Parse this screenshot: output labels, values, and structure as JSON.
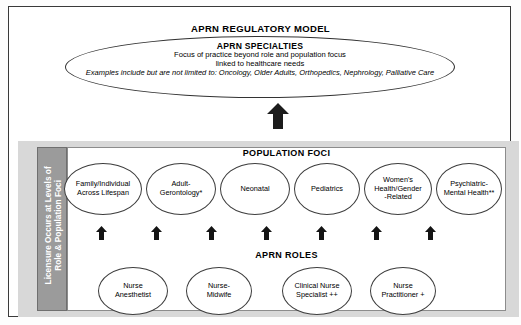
{
  "diagram": {
    "title": "APRN REGULATORY MODEL",
    "specialties": {
      "heading": "APRN SPECIALTIES",
      "line1": "Focus of practice beyond role and population focus",
      "line2": "linked to healthcare needs",
      "examples": "Examples include but are not limited to: Oncology, Older Adults, Orthopedics, Nephrology, Palliative Care"
    },
    "sidebar": {
      "label": "Licensure Occurs at Levels of\nRole & Population Foci"
    },
    "population": {
      "heading": "POPULATION FOCI",
      "nodes": [
        {
          "label": "Family/Individual\nAcross Lifespan",
          "left": 64,
          "width": 78
        },
        {
          "label": "Adult-\nGerontology*",
          "left": 146,
          "width": 70
        },
        {
          "label": "Neonatal",
          "left": 220,
          "width": 70
        },
        {
          "label": "Pediatrics",
          "left": 294,
          "width": 66
        },
        {
          "label": "Women's\nHealth/Gender\n-Related",
          "left": 364,
          "width": 68
        },
        {
          "label": "Psychiatric-\nMental Health**",
          "left": 436,
          "width": 66
        }
      ]
    },
    "roles": {
      "heading": "APRN ROLES",
      "nodes": [
        {
          "label": "Nurse\nAnesthetist",
          "left": 98,
          "width": 70
        },
        {
          "label": "Nurse-\nMidwife",
          "left": 186,
          "width": 66
        },
        {
          "label": "Clinical Nurse\nSpecialist ++",
          "left": 282,
          "width": 70
        },
        {
          "label": "Nurse\nPractitioner +",
          "left": 370,
          "width": 66
        }
      ]
    },
    "arrows": {
      "big_label": "up-arrow-specialties",
      "small_positions": [
        96,
        151,
        206,
        261,
        316,
        371,
        425
      ]
    },
    "colors": {
      "frame": "#3a3a3a",
      "band": "#d8d8d8",
      "sidebar": "#9b9b9b",
      "panel": "#ffffff",
      "ink": "#000000"
    }
  }
}
